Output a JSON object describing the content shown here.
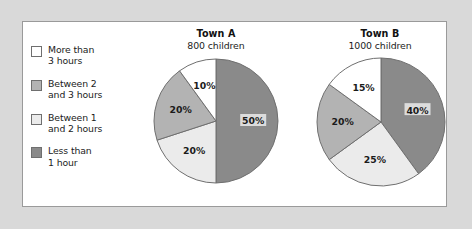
{
  "figure": {
    "background_color": "#d9d9d9",
    "panel_background": "#ffffff",
    "panel_border_color": "#9a9a9a"
  },
  "colors": {
    "white": "#ffffff",
    "light_gray": "#ebebeb",
    "medium_gray": "#b3b3b3",
    "dark_gray": "#8a8a8a",
    "outline": "#6f6f6f",
    "text": "#1b1b1b"
  },
  "legend": {
    "items": [
      {
        "label": "More than\n3 hours",
        "color": "#ffffff"
      },
      {
        "label": "Between 2\nand 3 hours",
        "color": "#b3b3b3"
      },
      {
        "label": "Between 1\nand 2 hours",
        "color": "#ebebeb"
      },
      {
        "label": "Less than\n1 hour",
        "color": "#8a8a8a"
      }
    ]
  },
  "charts": {
    "town_a": {
      "title": "Town A",
      "subtitle": "800 children",
      "labels": {
        "s0": "50%",
        "s1": "20%",
        "s2": "20%",
        "s3": "10%"
      }
    },
    "town_b": {
      "title": "Town B",
      "subtitle": "1000 children",
      "labels": {
        "s0": "40%",
        "s1": "25%",
        "s2": "20%",
        "s3": "15%"
      }
    }
  },
  "chart_data": [
    {
      "type": "pie",
      "title": "Town A",
      "subtitle": "800 children",
      "total": 800,
      "units": "children",
      "start_angle_deg": 90,
      "direction": "clockwise",
      "categories": [
        "Less than 1 hour",
        "Between 1 and 2 hours",
        "Between 2 and 3 hours",
        "More than 3 hours"
      ],
      "values": [
        50,
        20,
        20,
        10
      ],
      "value_unit": "percent",
      "counts": [
        400,
        160,
        160,
        80
      ],
      "data_labels": [
        "50%",
        "20%",
        "20%",
        "10%"
      ],
      "slice_colors": [
        "#8a8a8a",
        "#ebebeb",
        "#b3b3b3",
        "#ffffff"
      ],
      "legend": [
        "More than 3 hours",
        "Between 2 and 3 hours",
        "Between 1 and 2 hours",
        "Less than 1 hour"
      ],
      "legend_position": "left",
      "grid": false
    },
    {
      "type": "pie",
      "title": "Town B",
      "subtitle": "1000 children",
      "total": 1000,
      "units": "children",
      "start_angle_deg": 90,
      "direction": "clockwise",
      "categories": [
        "Less than 1 hour",
        "Between 1 and 2 hours",
        "Between 2 and 3 hours",
        "More than 3 hours"
      ],
      "values": [
        40,
        25,
        20,
        15
      ],
      "value_unit": "percent",
      "counts": [
        400,
        250,
        200,
        150
      ],
      "data_labels": [
        "40%",
        "25%",
        "20%",
        "15%"
      ],
      "slice_colors": [
        "#8a8a8a",
        "#ebebeb",
        "#b3b3b3",
        "#ffffff"
      ],
      "legend": [
        "More than 3 hours",
        "Between 2 and 3 hours",
        "Between 1 and 2 hours",
        "Less than 1 hour"
      ],
      "legend_position": "left",
      "grid": false
    }
  ]
}
